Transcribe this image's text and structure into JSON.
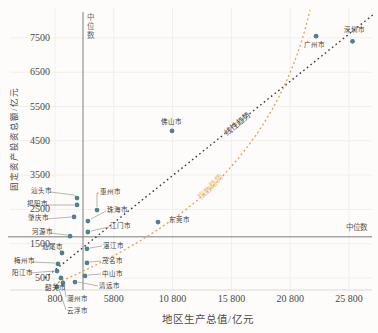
{
  "chart_data": {
    "type": "scatter",
    "title": "",
    "xlabel": "地区生产总值/亿元",
    "ylabel": "固定资产投资总额/亿元",
    "unit": "亿元",
    "grid": true,
    "x_axis": {
      "tick_values": [
        800,
        5800,
        10800,
        15800,
        20800,
        25800
      ],
      "tick_labels": [
        "800",
        "5800",
        "10 800",
        "15 800",
        "20 800",
        "25 800"
      ],
      "range": [
        400,
        27500
      ]
    },
    "y_axis": {
      "tick_values": [
        7500,
        6500,
        5500,
        4500,
        3500,
        2500,
        1500,
        500
      ],
      "tick_labels": [
        "7500",
        "6500",
        "5500",
        "4500",
        "3500",
        "2500",
        "1500",
        "500"
      ],
      "range": [
        0,
        8100
      ]
    },
    "medians": {
      "x": {
        "value": 3180,
        "label": "中位数"
      },
      "y": {
        "value": 1700,
        "label": "中位数"
      }
    },
    "trends": [
      {
        "name": "linear",
        "label": "线性趋势",
        "style": "dotted",
        "color": "#3d3d3d"
      },
      {
        "name": "exponential",
        "label": "指数趋势",
        "style": "dashed",
        "color": "#e5a055"
      }
    ],
    "point_color": "#4e828c",
    "leader_color": "#a8a39c",
    "grid_color": "#f1efeb",
    "median_line_color": "#7d7d7d",
    "points": [
      {
        "city": "广州市",
        "gdp": 23000,
        "investment": 7550,
        "label_px": [
          304,
          42
        ]
      },
      {
        "city": "深圳市",
        "gdp": 26100,
        "investment": 7400,
        "label_px": [
          344,
          27
        ]
      },
      {
        "city": "佛山市",
        "gdp": 10750,
        "investment": 4790,
        "label_px": [
          161,
          119
        ]
      },
      {
        "city": "东莞市",
        "gdp": 9560,
        "investment": 2130,
        "label_px": [
          169,
          217
        ]
      },
      {
        "city": "惠州市",
        "gdp": 4370,
        "investment": 2480,
        "label_px": [
          100,
          189
        ],
        "leader": [
          [
            97,
            207
          ],
          [
            97,
            193
          ],
          [
            99,
            193
          ]
        ]
      },
      {
        "city": "珠海市",
        "gdp": 3600,
        "investment": 2160,
        "label_px": [
          107,
          207
        ],
        "leader": [
          [
            91,
            219
          ],
          [
            106,
            211
          ]
        ]
      },
      {
        "city": "江门市",
        "gdp": 3600,
        "investment": 1840,
        "label_px": [
          110,
          223
        ],
        "leader": [
          [
            91,
            231
          ],
          [
            109,
            227
          ]
        ]
      },
      {
        "city": "湛江市",
        "gdp": 3520,
        "investment": 1350,
        "label_px": [
          103,
          243
        ],
        "leader": [
          [
            90,
            248
          ],
          [
            102,
            246
          ]
        ]
      },
      {
        "city": "茂名市",
        "gdp": 3520,
        "investment": 940,
        "label_px": [
          102,
          258
        ],
        "leader": [
          [
            90,
            262
          ],
          [
            101,
            261
          ]
        ]
      },
      {
        "city": "中山市",
        "gdp": 3350,
        "investment": 560,
        "label_px": [
          102,
          271
        ],
        "leader": [
          [
            88,
            275
          ],
          [
            101,
            274
          ]
        ]
      },
      {
        "city": "清远市",
        "gdp": 2500,
        "investment": 380,
        "label_px": [
          99,
          283
        ],
        "leader": [
          [
            78,
            282
          ],
          [
            98,
            286
          ]
        ]
      },
      {
        "city": "汕头市",
        "gdp": 2670,
        "investment": 2830,
        "label_px": [
          31,
          188
        ],
        "leader": [
          [
            50,
            192
          ],
          [
            74,
            195
          ],
          [
            77,
            197
          ]
        ]
      },
      {
        "city": "揭阳市",
        "gdp": 2670,
        "investment": 2630,
        "label_px": [
          27,
          201
        ],
        "leader": [
          [
            45,
            205
          ],
          [
            74,
            205
          ]
        ]
      },
      {
        "city": "肇庆市",
        "gdp": 2415,
        "investment": 2280,
        "label_px": [
          28,
          215
        ],
        "leader": [
          [
            46,
            219
          ],
          [
            71,
            217
          ]
        ]
      },
      {
        "city": "河源市",
        "gdp": 2075,
        "investment": 1720,
        "label_px": [
          32,
          229
        ],
        "leader": [
          [
            50,
            233
          ],
          [
            67,
            235
          ]
        ]
      },
      {
        "city": "汕尾市",
        "gdp": 1395,
        "investment": 1230,
        "label_px": [
          42,
          244
        ],
        "leader": [
          [
            58,
            248
          ],
          [
            61,
            251
          ]
        ]
      },
      {
        "city": "梅州市",
        "gdp": 1055,
        "investment": 910,
        "label_px": [
          14,
          258
        ],
        "leader": [
          [
            32,
            262
          ],
          [
            55,
            263
          ]
        ]
      },
      {
        "city": "阳江市",
        "gdp": 970,
        "investment": 700,
        "label_px": [
          12,
          270
        ],
        "leader": [
          [
            30,
            273
          ],
          [
            54,
            271
          ]
        ]
      },
      {
        "city": "韶关市",
        "gdp": 1310,
        "investment": 500,
        "label_px": [
          45,
          285
        ],
        "leader": [
          [
            60,
            281
          ],
          [
            55,
            287
          ]
        ]
      },
      {
        "city": "潮州市",
        "gdp": 1480,
        "investment": 350,
        "label_px": [
          67,
          296
        ],
        "leader": [
          [
            64,
            285
          ],
          [
            66,
            297
          ]
        ]
      },
      {
        "city": "云浮市",
        "gdp": 970,
        "investment": 240,
        "label_px": [
          67,
          308
        ],
        "leader": [
          [
            59,
            289
          ],
          [
            66,
            310
          ]
        ]
      }
    ]
  }
}
